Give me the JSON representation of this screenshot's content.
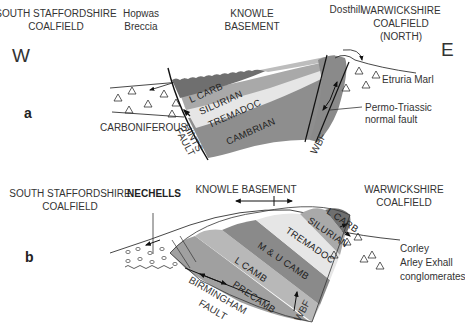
{
  "diagram": {
    "type": "geological-cross-sections",
    "directions": {
      "west": "W",
      "east": "E"
    },
    "colors": {
      "l_carb": "#6f6f6f",
      "silurian": "#a9a9a9",
      "tremadoc": "#e6e6e6",
      "cambrian": "#8e8e8e",
      "m_u_camb": "#8a8a8a",
      "l_camb": "#b8b8b8",
      "precamb": "#a0a0a0",
      "line": "#222222"
    },
    "section_a": {
      "panel_label": "a",
      "headers": {
        "south_staffordshire": [
          "SOUTH STAFFORDSHIRE",
          "COALFIELD"
        ],
        "hopwas": [
          "Hopwas",
          "Breccia"
        ],
        "knowle": [
          "KNOWLE",
          "BASEMENT"
        ],
        "dosthill": "Dosthill",
        "warwickshire": [
          "WARWICKSHIRE",
          "COALFIELD",
          "(NORTH)"
        ]
      },
      "layers": [
        "L CARB",
        "SILURIAN",
        "TREMADOC",
        "CAMBRIAN"
      ],
      "labels": {
        "carboniferous": "CARBONIFEROUS",
        "hints_fault": [
          "HINTS",
          "FAULT"
        ],
        "wbf": "WBF",
        "etruria_marl": "Etruria Marl",
        "permo_triassic": [
          "Permo-Triassic",
          "normal fault"
        ]
      }
    },
    "section_b": {
      "panel_label": "b",
      "headers": {
        "south_staffordshire": [
          "SOUTH STAFFORDSHIRE",
          "COALFIELD"
        ],
        "nechells": "NECHELLS",
        "knowle": "KNOWLE BASEMENT",
        "warwickshire": [
          "WARWICKSHIRE",
          "COALFIELD"
        ]
      },
      "layers": [
        "L CARB",
        "SILURIAN",
        "TREMADOC",
        "M & U CAMB",
        "L CAMB",
        "PRECAMB"
      ],
      "labels": {
        "birmingham_fault": [
          "BIRMINGHAM",
          "FAULT"
        ],
        "wbf": "WBF",
        "corley": [
          "Corley",
          "Arley Exhall",
          "conglomerates"
        ]
      }
    }
  }
}
